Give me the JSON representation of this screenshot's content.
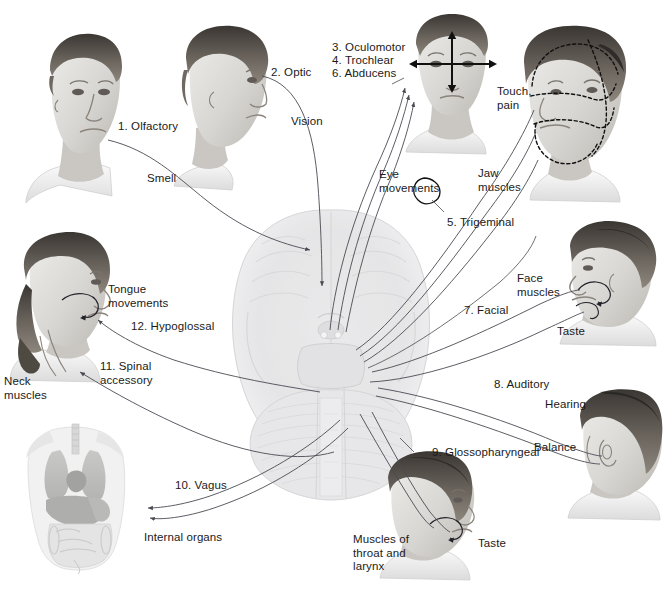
{
  "figure": {
    "background_color": "#ffffff",
    "text_color": "#1a1a1a",
    "line_color": "#4a4a52"
  },
  "nerves": [
    {
      "number": "1",
      "label": "1. Olfactory",
      "function": "Smell",
      "type": "sensory"
    },
    {
      "number": "2",
      "label": "2. Optic",
      "function": "Vision",
      "type": "sensory"
    },
    {
      "number": "3",
      "label": "3. Oculomotor",
      "function": "Eye\nmovements",
      "type": "motor"
    },
    {
      "number": "4",
      "label": "4. Trochlear",
      "function": "Eye\nmovements",
      "type": "motor"
    },
    {
      "number": "5",
      "label": "5. Trigeminal",
      "function": "Touch,\npain",
      "type": "mixed"
    },
    {
      "number": "6",
      "label": "6. Abducens",
      "function": "Eye\nmovements",
      "type": "motor"
    },
    {
      "number": "7",
      "label": "7. Facial",
      "function": "Face\nmuscles",
      "type": "mixed"
    },
    {
      "number": "8",
      "label": "8. Auditory",
      "function": "Hearing",
      "type": "sensory"
    },
    {
      "number": "9",
      "label": "9. Glossopharyngeal",
      "function": "Taste",
      "type": "mixed"
    },
    {
      "number": "10",
      "label": "10. Vagus",
      "function": "Internal organs",
      "type": "mixed"
    },
    {
      "number": "11",
      "label": "11. Spinal\naccessory",
      "function": "Neck\nmuscles",
      "type": "motor"
    },
    {
      "number": "12",
      "label": "12. Hypoglossal",
      "function": "Tongue\nmovements",
      "type": "motor"
    }
  ],
  "labels": {
    "olfactory": "1. Olfactory",
    "smell": "Smell",
    "optic": "2. Optic",
    "vision": "Vision",
    "oculomotor": "3. Oculomotor",
    "trochlear": "4. Trochlear",
    "abducens": "6. Abducens",
    "eye_movements": "Eye\nmovements",
    "touch_pain": "Touch,\npain",
    "jaw_muscles": "Jaw\nmuscles",
    "trigeminal": "5. Trigeminal",
    "face_muscles": "Face\nmuscles",
    "facial": "7. Facial",
    "taste_facial": "Taste",
    "auditory": "8. Auditory",
    "hearing": "Hearing",
    "balance": "Balance",
    "glossopharyngeal": "9. Glossopharyngeal",
    "taste_glosso": "Taste",
    "muscles_throat": "Muscles of\nthroat and\nlarynx",
    "vagus": "10. Vagus",
    "internal_organs": "Internal organs",
    "spinal_accessory": "11. Spinal\naccessory",
    "neck_muscles": "Neck\nmuscles",
    "hypoglossal": "12. Hypoglossal",
    "tongue_movements": "Tongue\nmovements"
  },
  "illustrations": [
    {
      "name": "head-olfactory",
      "description": "Three-quarter view young man's head, nose highlighted"
    },
    {
      "name": "head-optic",
      "description": "Profile view head, eye highlighted"
    },
    {
      "name": "head-eye-movements",
      "description": "Frontal view head with black arrows across the eyes"
    },
    {
      "name": "head-trigeminal",
      "description": "Three-quarter head with dashed dermatome regions on the face"
    },
    {
      "name": "head-facial",
      "description": "Profile head with facial muscle and taste indicators"
    },
    {
      "name": "head-auditory",
      "description": "Rear-profile head showing the ear"
    },
    {
      "name": "head-glossopharyngeal",
      "description": "Profile head for throat, larynx and taste"
    },
    {
      "name": "head-hypoglossal",
      "description": "Profile head with tongue and neck indicators"
    },
    {
      "name": "brain-ventral-view",
      "description": "Pale grayscale ventral view of the brain, cerebellum and brainstem"
    },
    {
      "name": "torso-internal-organs",
      "description": "Translucent torso showing lungs, heart, liver and intestines"
    }
  ]
}
